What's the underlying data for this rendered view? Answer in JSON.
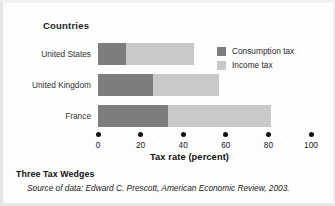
{
  "chart_data": {
    "type": "bar",
    "orientation": "horizontal",
    "stacked": true,
    "categories": [
      "United States",
      "United Kingdom",
      "France"
    ],
    "series": [
      {
        "name": "Consumption tax",
        "values": [
          13,
          26,
          33
        ],
        "color": "#7d7d7d"
      },
      {
        "name": "Income tax",
        "values": [
          32,
          31,
          48
        ],
        "color": "#c9c9c9"
      }
    ],
    "totals": [
      45,
      57,
      81
    ],
    "title": "Three Tax Wedges",
    "category_axis_label": "Countries",
    "xlabel": "Tax rate (percent)",
    "ylabel": "",
    "xlim": [
      0,
      100
    ],
    "xticks": [
      0,
      20,
      40,
      60,
      80,
      100
    ],
    "xtick_labels": [
      "0",
      "20",
      "40",
      "60",
      "80",
      "100"
    ],
    "grid": false,
    "legend_position": "top-right",
    "tick_marker_style": "dot",
    "source_note": "Source of data: Edward C. Prescott, American Economic Review, 2003."
  },
  "figure": {
    "category_axis_label": "Countries",
    "axis_title": "Tax rate (percent)",
    "caption_title": "Three Tax Wedges",
    "caption_source": "Source of data: Edward C. Prescott, American Economic Review, 2003."
  },
  "rows": [
    {
      "label": "United States"
    },
    {
      "label": "United Kingdom"
    },
    {
      "label": "France"
    }
  ],
  "ticks": [
    {
      "label": "0"
    },
    {
      "label": "20"
    },
    {
      "label": "40"
    },
    {
      "label": "60"
    },
    {
      "label": "80"
    },
    {
      "label": "100"
    }
  ],
  "legend": [
    {
      "label": "Consumption tax"
    },
    {
      "label": "Income tax"
    }
  ]
}
